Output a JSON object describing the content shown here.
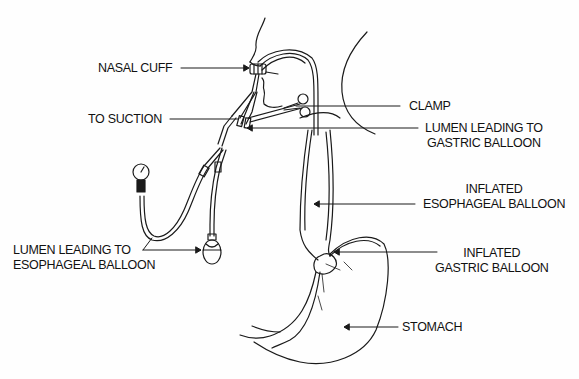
{
  "diagram": {
    "line_color": "#1a1a1a",
    "background": "#fefefe",
    "labels": {
      "nasal_cuff": "NASAL CUFF",
      "to_suction": "TO SUCTION",
      "clamp": "CLAMP",
      "lumen_gastric_line1": "LUMEN LEADING TO",
      "lumen_gastric_line2": "GASTRIC BALLOON",
      "esophageal_line1": "INFLATED",
      "esophageal_line2": "ESOPHAGEAL BALLOON",
      "gastric_line1": "INFLATED",
      "gastric_line2": "GASTRIC BALLOON",
      "lumen_esophageal_line1": "LUMEN LEADING TO",
      "lumen_esophageal_line2": "ESOPHAGEAL BALLOON",
      "stomach": "STOMACH"
    }
  }
}
